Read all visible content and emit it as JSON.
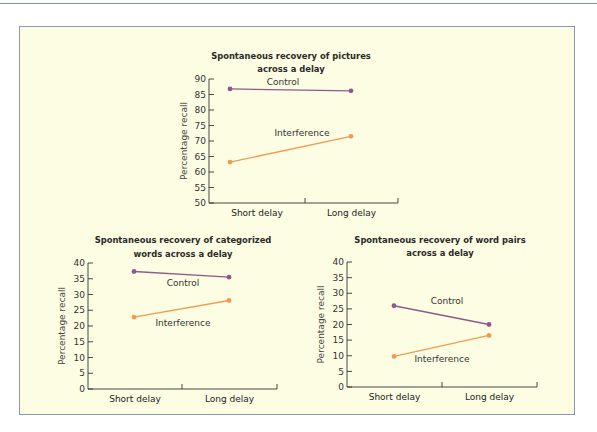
{
  "colors": {
    "panel_bg": "#fdfde3",
    "panel_border": "#8c97b4",
    "control": "#8e5a8c",
    "interference": "#f29a52"
  },
  "chart_data": [
    {
      "type": "line",
      "title": "Spontaneous recovery of pictures across a delay",
      "title_lines": [
        "Spontaneous recovery of pictures",
        "across a delay"
      ],
      "xlabel": "",
      "ylabel": "Percentage recall",
      "categories": [
        "Short delay",
        "Long delay"
      ],
      "ylim": [
        50,
        90
      ],
      "yticks": [
        50,
        55,
        60,
        65,
        70,
        75,
        80,
        85,
        90
      ],
      "series": [
        {
          "name": "Control",
          "values": [
            86.8,
            86.2
          ]
        },
        {
          "name": "Interference",
          "values": [
            63.2,
            71.5
          ]
        }
      ],
      "grid": false,
      "legend": "inline labels"
    },
    {
      "type": "line",
      "title": "Spontaneous recovery of categorized words across a delay",
      "title_lines": [
        "Spontaneous recovery of categorized",
        "words across a delay"
      ],
      "xlabel": "",
      "ylabel": "Percentage recall",
      "categories": [
        "Short delay",
        "Long delay"
      ],
      "ylim": [
        0,
        40
      ],
      "yticks": [
        0,
        5,
        10,
        15,
        20,
        25,
        30,
        35,
        40
      ],
      "series": [
        {
          "name": "Control",
          "values": [
            37.3,
            35.5
          ]
        },
        {
          "name": "Interference",
          "values": [
            22.8,
            28.1
          ]
        }
      ],
      "grid": false,
      "legend": "inline labels"
    },
    {
      "type": "line",
      "title": "Spontaneous recovery of word pairs across a delay",
      "title_lines": [
        "Spontaneous recovery of word pairs",
        "across a delay"
      ],
      "xlabel": "",
      "ylabel": "Percentage recall",
      "categories": [
        "Short delay",
        "Long delay"
      ],
      "ylim": [
        0,
        40
      ],
      "yticks": [
        0,
        5,
        10,
        15,
        20,
        25,
        30,
        35,
        40
      ],
      "series": [
        {
          "name": "Control",
          "values": [
            26.0,
            20.0
          ]
        },
        {
          "name": "Interference",
          "values": [
            9.8,
            16.5
          ]
        }
      ],
      "grid": false,
      "legend": "inline labels"
    }
  ]
}
